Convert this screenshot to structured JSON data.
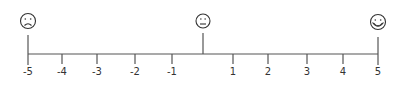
{
  "scale": {
    "min": -5,
    "max": 5,
    "line_color": "#555555",
    "ticks": [
      {
        "value": -5,
        "label": "-5",
        "x": 28
      },
      {
        "value": -4,
        "label": "-4",
        "x": 62
      },
      {
        "value": -3,
        "label": "-3",
        "x": 97
      },
      {
        "value": -2,
        "label": "-2",
        "x": 135
      },
      {
        "value": -1,
        "label": "-1",
        "x": 172
      },
      {
        "value": 1,
        "label": "1",
        "x": 233
      },
      {
        "value": 2,
        "label": "2",
        "x": 268
      },
      {
        "value": 3,
        "label": "3",
        "x": 307
      },
      {
        "value": 4,
        "label": "4",
        "x": 343
      },
      {
        "value": 5,
        "label": "5",
        "x": 378
      }
    ],
    "anchors": [
      {
        "position": "left",
        "value": -5,
        "icon": "sad-face-icon",
        "x": 28
      },
      {
        "position": "center",
        "value": 0,
        "icon": "neutral-face-icon",
        "x": 203
      },
      {
        "position": "right",
        "value": 5,
        "icon": "happy-face-icon",
        "x": 378
      }
    ]
  }
}
